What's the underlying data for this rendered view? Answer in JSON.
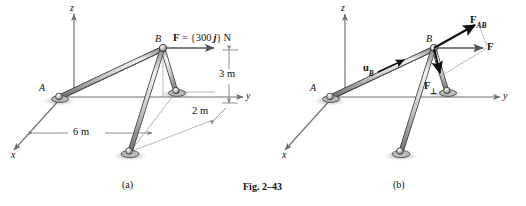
{
  "figure": {
    "caption": "Fig. 2–43",
    "panels": [
      {
        "id": "a",
        "caption": "(a)",
        "axes": {
          "x": "x",
          "y": "y",
          "z": "z"
        },
        "points": [
          {
            "name": "A",
            "label": "A"
          },
          {
            "name": "B",
            "label": "B"
          }
        ],
        "dimensions": [
          {
            "name": "height",
            "label": "3 m"
          },
          {
            "name": "offset",
            "label": "2 m"
          },
          {
            "name": "span",
            "label": "6 m"
          }
        ],
        "vectors": [
          {
            "name": "applied-force",
            "label": "F = {300 j} N",
            "symbol": "F",
            "value": "300",
            "unit": "N",
            "direction": "j"
          }
        ]
      },
      {
        "id": "b",
        "caption": "(b)",
        "axes": {
          "x": "x",
          "y": "y",
          "z": "z"
        },
        "points": [
          {
            "name": "A",
            "label": "A"
          },
          {
            "name": "B",
            "label": "B"
          }
        ],
        "vectors": [
          {
            "name": "unit-vector-ub",
            "base": "u",
            "sub": "B"
          },
          {
            "name": "force-f",
            "base": "F",
            "sub": ""
          },
          {
            "name": "component-parallel",
            "base": "F",
            "sub": "AB"
          },
          {
            "name": "component-perpendicular",
            "base": "F",
            "sub": "⊥"
          }
        ]
      }
    ]
  },
  "colors": {
    "ink": "#111111",
    "axis": "#6f6f6f",
    "member_fill": "#cfcfcf",
    "member_edge": "#3a3a3a",
    "shadow": "#c9c9c9",
    "thin_line": "#8c8c8c"
  }
}
